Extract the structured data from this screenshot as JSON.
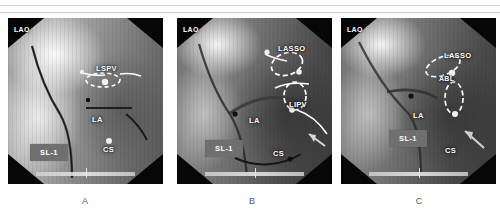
{
  "figure": {
    "panels": [
      {
        "caption": "A",
        "projection_label": "LAO",
        "labels": [
          {
            "name": "lspv-label",
            "text": "LSPV"
          },
          {
            "name": "la-label",
            "text": "LA"
          },
          {
            "name": "cs-label",
            "text": "CS"
          }
        ],
        "sheath_label": "SL-1"
      },
      {
        "caption": "B",
        "projection_label": "LAO",
        "labels": [
          {
            "name": "lasso-label",
            "text": "LASSO"
          },
          {
            "name": "lipv-label",
            "text": "LIPV"
          },
          {
            "name": "la-label",
            "text": "LA"
          },
          {
            "name": "cs-label",
            "text": "CS"
          }
        ],
        "sheath_label": "SL-1"
      },
      {
        "caption": "C",
        "projection_label": "LAO",
        "labels": [
          {
            "name": "lasso-label",
            "text": "LASSO"
          },
          {
            "name": "abl-label",
            "text": "ABL"
          },
          {
            "name": "la-label",
            "text": "LA"
          },
          {
            "name": "cs-label",
            "text": "CS"
          }
        ],
        "sheath_label": "SL-1"
      }
    ]
  },
  "colors": {
    "label_text": "#ffffff",
    "sheath_box": "#6f6f6f",
    "caption_text": "#53575c",
    "rule": "#d3d5d8"
  }
}
